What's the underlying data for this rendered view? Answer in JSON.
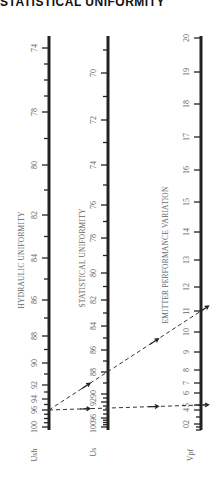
{
  "title": "STATISTICAL UNIFORMITY",
  "chart_data": {
    "type": "nomogram",
    "title": "STATISTICAL UNIFORMITY",
    "axes": [
      {
        "id": "ush",
        "symbol": "Ush",
        "name": "HYDRAULIC UNIFORMITY",
        "range": [
          100,
          74
        ],
        "labeled_ticks": [
          100,
          96,
          94,
          92,
          90,
          88,
          86,
          84,
          82,
          80,
          78,
          74
        ],
        "tick_labels": [
          "100",
          "96",
          "94",
          "92",
          "90",
          "88",
          "86",
          "84",
          "82",
          "80",
          "78",
          "74"
        ]
      },
      {
        "id": "us",
        "symbol": "Us",
        "name": "STATISTICAL UNIFORMITY",
        "range": [
          100,
          69
        ],
        "labeled_ticks": [
          100,
          96,
          92,
          90,
          88,
          86,
          84,
          82,
          80,
          78,
          76,
          74,
          72,
          70
        ],
        "tick_labels": [
          "100",
          "96",
          "92",
          "90",
          "88",
          "86",
          "84",
          "82",
          "80",
          "78",
          "76",
          "74",
          "72",
          "70"
        ]
      },
      {
        "id": "vpf",
        "symbol": "Vpf",
        "name": "EMITTER PERFORMANCE VARIATION",
        "range": [
          0,
          20
        ],
        "labeled_ticks": [
          2,
          4,
          5,
          6,
          7,
          8,
          9,
          10,
          11,
          12,
          13,
          14,
          15,
          16,
          17,
          18,
          19,
          20
        ],
        "tick_labels": [
          "02",
          "4",
          "5",
          "6",
          "7",
          "8",
          "9",
          "10",
          "11",
          "12",
          "13",
          "14",
          "15",
          "16",
          "17",
          "18",
          "19",
          "20"
        ]
      }
    ],
    "example_lines": [
      {
        "name": "horizontal-example",
        "ush": 96,
        "us": 95,
        "vpf": 5,
        "style": "dashed"
      },
      {
        "name": "diagonal-example",
        "ush": 96,
        "us": 88,
        "vpf": 11,
        "style": "dashed"
      }
    ]
  }
}
